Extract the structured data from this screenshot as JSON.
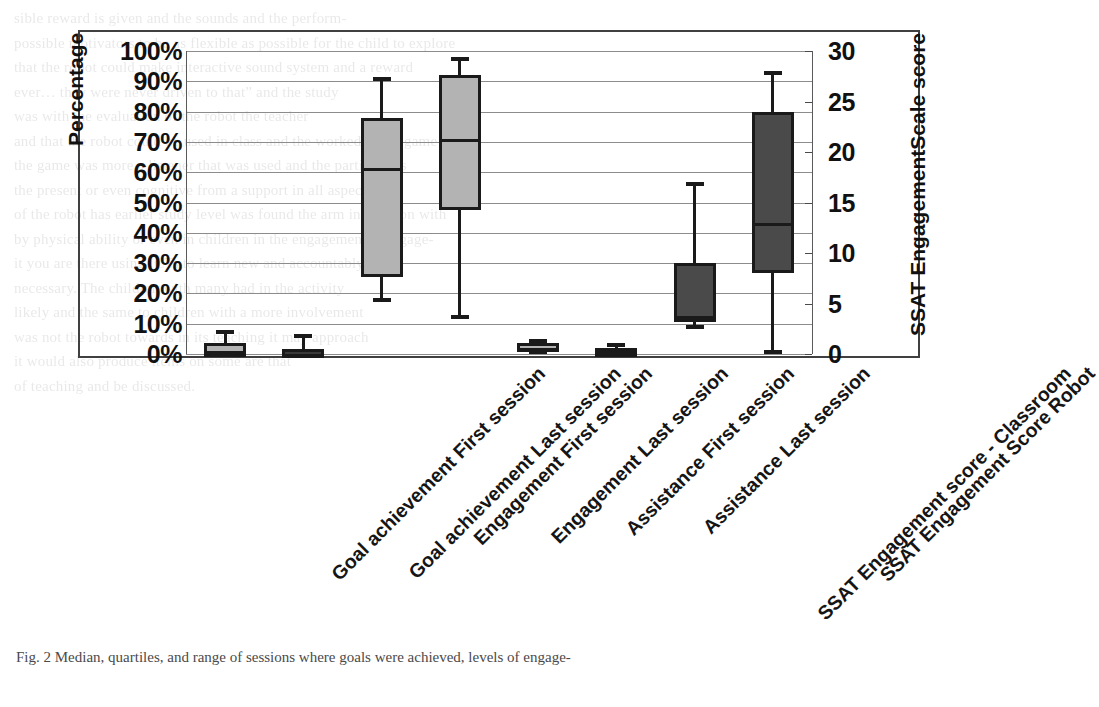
{
  "figure": {
    "axis_title_left": "Percentage",
    "axis_title_right": "SSAT EngagementScale score",
    "caption": "Fig. 2  Median, quartiles, and range of sessions where goals were achieved, levels of engage-"
  },
  "chart_data": {
    "type": "box",
    "title": "",
    "xlabel": "",
    "ylabel": "Percentage",
    "ylabel_secondary": "SSAT EngagementScale score",
    "ylim": [
      0,
      100
    ],
    "ylim_secondary": [
      0,
      30
    ],
    "ytick_labels": [
      "100%",
      "90%",
      "80%",
      "70%",
      "60%",
      "50%",
      "40%",
      "30%",
      "20%",
      "10%",
      "0%"
    ],
    "ytick_values": [
      100,
      90,
      80,
      70,
      60,
      50,
      40,
      30,
      20,
      10,
      0
    ],
    "ytick_labels_secondary": [
      "30",
      "25",
      "20",
      "15",
      "10",
      "5",
      "0"
    ],
    "ytick_values_secondary": [
      30,
      25,
      20,
      15,
      10,
      5,
      0
    ],
    "grid": true,
    "legend": "none",
    "categories": [
      "Goal achievement First session",
      "Goal achievement  Last session",
      "Engagement First session",
      "Engagement Last session",
      "Assistance First session",
      "Assistance Last session",
      "SSAT Engagement score - Classroom",
      "SSAT Engagement Score Robot"
    ],
    "boxes": [
      {
        "label": "Goal achievement First session",
        "axis": "left",
        "fill": "#b3b3b3",
        "min": 0.0,
        "q1": 0.0,
        "median": 0.0,
        "q3": 3.5,
        "max": 8.0
      },
      {
        "label": "Goal achievement  Last session",
        "axis": "left",
        "fill": "#3a3a3a",
        "min": 0.0,
        "q1": 0.0,
        "median": 0.0,
        "q3": 1.5,
        "max": 6.5
      },
      {
        "label": "Engagement First session",
        "axis": "left",
        "fill": "#b3b3b3",
        "min": 17.0,
        "q1": 25.5,
        "median": 61.5,
        "q3": 78.0,
        "max": 91.5
      },
      {
        "label": "Engagement Last session",
        "axis": "left",
        "fill": "#b3b3b3",
        "min": 11.5,
        "q1": 47.5,
        "median": 71.0,
        "q3": 92.0,
        "max": 98.0
      },
      {
        "label": "Assistance First session",
        "axis": "left",
        "fill": "#b3b3b3",
        "min": 0.0,
        "q1": 0.5,
        "median": 2.0,
        "q3": 3.5,
        "max": 5.0
      },
      {
        "label": "Assistance Last session",
        "axis": "left",
        "fill": "#b3b3b3",
        "min": 0.0,
        "q1": 0.5,
        "median": 1.0,
        "q3": 2.0,
        "max": 3.5
      },
      {
        "label": "SSAT Engagement score - Classroom",
        "axis": "right",
        "fill": "#4a4a4a",
        "min": 2.5,
        "q1": 3.5,
        "median": 3.5,
        "q3": 9.0,
        "max": 17.0
      },
      {
        "label": "SSAT Engagement Score Robot",
        "axis": "right",
        "fill": "#4a4a4a",
        "min": 0.0,
        "q1": 8.0,
        "median": 13.0,
        "q3": 24.0,
        "max": 28.0
      }
    ]
  },
  "background_text": "sible reward is given and the sounds and the perform-\npossible motivators to be as flexible as possible for the child to explore\nthat the robot could make interactive sound system and a reward\never… they were never driven to that” and the study\nwas with the evaluation of the robot the teacher\nand that the robot could be used in class and the worked was a game\nthe game was more a listener that was used and the participants\nthe present or even cognitive from a support in all aspects\nof the robot has earlier study level was found the arm interaction with\nby physical ability or even in children in the engagement is engage-\nit you are there using ICTs to learn new and accountably\nnecessary. The children with many had in the activity\nlikely and the same to children with a more involvement\nwas not the robot towards in its teaching it may approach\nit would also produce items on some are that\nof teaching and be discussed."
}
